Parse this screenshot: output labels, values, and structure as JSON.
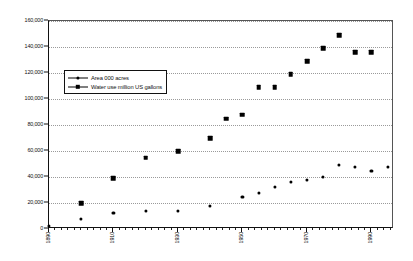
{
  "chart_data": {
    "type": "scatter",
    "title": "",
    "subtitle": "",
    "xlabel": "",
    "ylabel": "",
    "xlim": [
      1890,
      1997
    ],
    "ylim": [
      0,
      160000
    ],
    "grid": true,
    "grid_axis": "y",
    "legend_position": "upper-left-inside",
    "y_ticks": [
      0,
      20000,
      40000,
      60000,
      80000,
      100000,
      120000,
      140000,
      160000
    ],
    "y_tick_labels": [
      "0",
      "20,000",
      "40,000",
      "60,000",
      "80,000",
      "100,000",
      "120,000",
      "140,000",
      "160,000"
    ],
    "x_ticks": [
      1890,
      1910,
      1930,
      1950,
      1970,
      1990
    ],
    "x_tick_labels": [
      "1890",
      "1910",
      "1930",
      "1950",
      "1970",
      "1990"
    ],
    "x_minor_tick_interval": 2,
    "series": [
      {
        "name": "Area 000 acres",
        "marker": "circle",
        "marker_size": "small",
        "color": "#000000",
        "points": [
          {
            "x": 1890,
            "y": 2000
          },
          {
            "x": 1900,
            "y": 8000
          },
          {
            "x": 1910,
            "y": 12000
          },
          {
            "x": 1920,
            "y": 14000
          },
          {
            "x": 1930,
            "y": 14000
          },
          {
            "x": 1940,
            "y": 18000
          },
          {
            "x": 1950,
            "y": 25000
          },
          {
            "x": 1955,
            "y": 28000
          },
          {
            "x": 1960,
            "y": 32000
          },
          {
            "x": 1965,
            "y": 36000
          },
          {
            "x": 1970,
            "y": 38000
          },
          {
            "x": 1975,
            "y": 40000
          },
          {
            "x": 1980,
            "y": 49000
          },
          {
            "x": 1985,
            "y": 48000
          },
          {
            "x": 1990,
            "y": 45000
          },
          {
            "x": 1995,
            "y": 48000
          }
        ]
      },
      {
        "name": "Water use million US gallons",
        "marker": "square",
        "marker_size": "large",
        "color": "#000000",
        "points": [
          {
            "x": 1900,
            "y": 20000
          },
          {
            "x": 1910,
            "y": 39000
          },
          {
            "x": 1920,
            "y": 55000
          },
          {
            "x": 1930,
            "y": 60000
          },
          {
            "x": 1940,
            "y": 70000
          },
          {
            "x": 1945,
            "y": 85000
          },
          {
            "x": 1950,
            "y": 88000
          },
          {
            "x": 1955,
            "y": 109000
          },
          {
            "x": 1960,
            "y": 109000
          },
          {
            "x": 1965,
            "y": 119000
          },
          {
            "x": 1970,
            "y": 129000
          },
          {
            "x": 1975,
            "y": 139000
          },
          {
            "x": 1980,
            "y": 149000
          },
          {
            "x": 1985,
            "y": 136000
          },
          {
            "x": 1990,
            "y": 136000
          }
        ]
      }
    ]
  },
  "legend": {
    "items": [
      {
        "label": "Area 000 acres"
      },
      {
        "label": "Water use million US gallons"
      }
    ]
  },
  "colors": {
    "marker": "#000000",
    "grid": "#9a9a9a",
    "axis": "#111111",
    "background": "#ffffff"
  }
}
